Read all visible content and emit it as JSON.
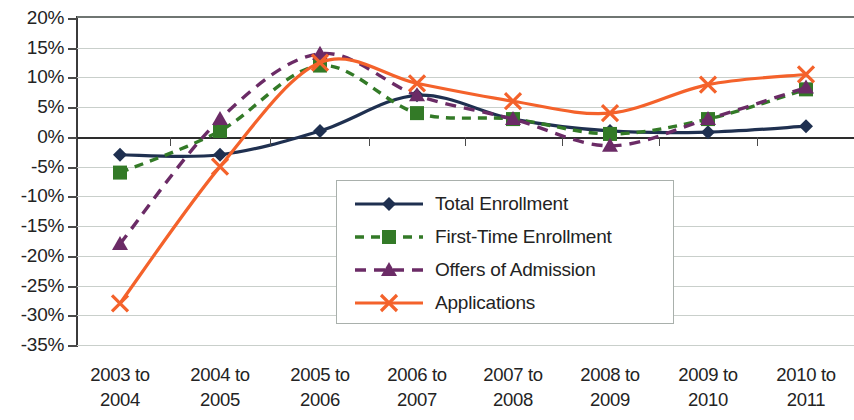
{
  "chart_data": {
    "type": "line",
    "title": "",
    "subtitle": "",
    "xlabel": "",
    "ylabel": "",
    "categories": [
      "2003 to\n2004",
      "2004 to\n2005",
      "2005 to\n2006",
      "2006 to\n2007",
      "2007 to\n2008",
      "2008 to\n2009",
      "2009 to\n2010",
      "2010 to\n2011"
    ],
    "category_lines": [
      [
        "2003 to",
        "2004"
      ],
      [
        "2004 to",
        "2005"
      ],
      [
        "2005 to",
        "2006"
      ],
      [
        "2006 to",
        "2007"
      ],
      [
        "2007 to",
        "2008"
      ],
      [
        "2008 to",
        "2009"
      ],
      [
        "2009 to",
        "2010"
      ],
      [
        "2010 to",
        "2011"
      ]
    ],
    "ylim": [
      -35,
      20
    ],
    "ytick_step": 5,
    "ytick_labels": [
      "20%",
      "15%",
      "10%",
      "5%",
      "0%",
      "-5%",
      "-10%",
      "-15%",
      "-20%",
      "-25%",
      "-30%",
      "-35%"
    ],
    "ytick_values": [
      20,
      15,
      10,
      5,
      0,
      -5,
      -10,
      -15,
      -20,
      -25,
      -30,
      -35
    ],
    "grid": true,
    "legend_position": "center",
    "value_unit": "percent",
    "series": [
      {
        "name": "Total Enrollment",
        "color": "#1F3050",
        "marker": "diamond",
        "dash": "solid",
        "values": [
          -3,
          -3,
          1,
          7,
          3,
          1,
          0.8,
          1.8
        ]
      },
      {
        "name": "First-Time Enrollment",
        "color": "#337A27",
        "marker": "square",
        "dash": "dashed",
        "values": [
          -6,
          1,
          12,
          4,
          3,
          0.5,
          3,
          8
        ]
      },
      {
        "name": "Offers of Admission",
        "color": "#6B2B66",
        "marker": "triangle",
        "dash": "dashed",
        "values": [
          -18,
          3,
          14,
          7,
          3,
          -1.5,
          3,
          8.3
        ]
      },
      {
        "name": "Applications",
        "color": "#F4622B",
        "marker": "x",
        "dash": "solid",
        "values": [
          -28,
          -5,
          12.5,
          9,
          6,
          4,
          8.8,
          10.5
        ]
      }
    ]
  },
  "legend": {
    "items": [
      {
        "label": "Total Enrollment"
      },
      {
        "label": "First-Time Enrollment"
      },
      {
        "label": "Offers of Admission"
      },
      {
        "label": "Applications"
      }
    ]
  }
}
